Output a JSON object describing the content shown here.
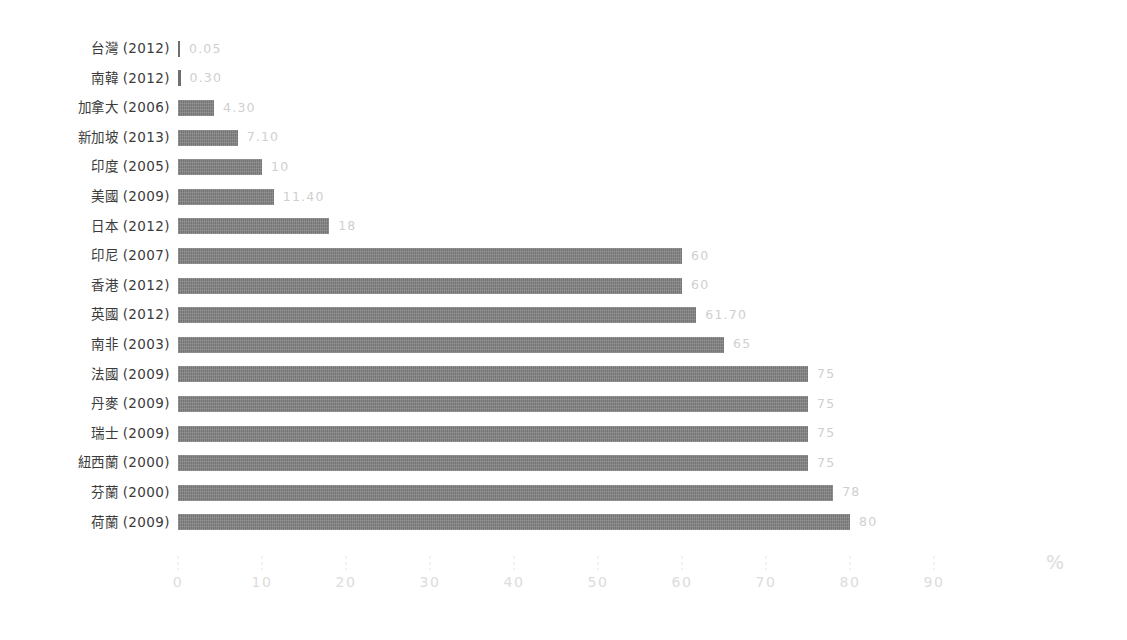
{
  "chart_data": {
    "type": "bar",
    "orientation": "horizontal",
    "title": "",
    "subtitle": "",
    "xlabel": "%",
    "ylabel": "",
    "xlim": [
      0,
      90
    ],
    "grid": false,
    "legend": null,
    "axis": {
      "unit_symbol": "%",
      "ticks": [
        0,
        10,
        20,
        30,
        40,
        50,
        60,
        70,
        80,
        90
      ],
      "tick_labels": [
        "0",
        "10",
        "20",
        "30",
        "40",
        "50",
        "60",
        "70",
        "80",
        "90"
      ]
    },
    "categories": [
      "台灣 (2012)",
      "南韓 (2012)",
      "加拿大 (2006)",
      "新加坡 (2013)",
      "印度 (2005)",
      "美國 (2009)",
      "日本 (2012)",
      "印尼 (2007)",
      "香港 (2012)",
      "英國 (2012)",
      "南非 (2003)",
      "法國 (2009)",
      "丹麥 (2009)",
      "瑞士 (2009)",
      "紐西蘭 (2000)",
      "芬蘭 (2000)",
      "荷蘭 (2009)"
    ],
    "values": [
      0.05,
      0.3,
      4.3,
      7.1,
      10,
      11.4,
      18,
      60,
      60,
      61.7,
      65,
      75,
      75,
      75,
      75,
      78,
      80
    ],
    "value_labels": [
      "0.05",
      "0.30",
      "4.30",
      "7.10",
      "10",
      "11.40",
      "18",
      "60",
      "60",
      "61.70",
      "65",
      "75",
      "75",
      "75",
      "75",
      "78",
      "80"
    ],
    "colors": {
      "bar": "#808080",
      "bar_tiny": "#6f6f6f",
      "category_label": "#3b3b3b",
      "value_label": "#cfcfcf",
      "axis_tick": "#e3e3e3",
      "axis_label": "#dcdcdc",
      "background": "#ffffff"
    }
  },
  "rows": [
    {
      "category": "台灣 (2012)",
      "value": 0.05,
      "value_label": "0.05"
    },
    {
      "category": "南韓 (2012)",
      "value": 0.3,
      "value_label": "0.30"
    },
    {
      "category": "加拿大 (2006)",
      "value": 4.3,
      "value_label": "4.30"
    },
    {
      "category": "新加坡 (2013)",
      "value": 7.1,
      "value_label": "7.10"
    },
    {
      "category": "印度 (2005)",
      "value": 10,
      "value_label": "10"
    },
    {
      "category": "美國 (2009)",
      "value": 11.4,
      "value_label": "11.40"
    },
    {
      "category": "日本 (2012)",
      "value": 18,
      "value_label": "18"
    },
    {
      "category": "印尼 (2007)",
      "value": 60,
      "value_label": "60"
    },
    {
      "category": "香港 (2012)",
      "value": 60,
      "value_label": "60"
    },
    {
      "category": "英國 (2012)",
      "value": 61.7,
      "value_label": "61.70"
    },
    {
      "category": "南非 (2003)",
      "value": 65,
      "value_label": "65"
    },
    {
      "category": "法國 (2009)",
      "value": 75,
      "value_label": "75"
    },
    {
      "category": "丹麥 (2009)",
      "value": 75,
      "value_label": "75"
    },
    {
      "category": "瑞士 (2009)",
      "value": 75,
      "value_label": "75"
    },
    {
      "category": "紐西蘭 (2000)",
      "value": 75,
      "value_label": "75"
    },
    {
      "category": "芬蘭 (2000)",
      "value": 78,
      "value_label": "78"
    },
    {
      "category": "荷蘭 (2009)",
      "value": 80,
      "value_label": "80"
    }
  ],
  "axis": {
    "ticks": [
      "0",
      "10",
      "20",
      "30",
      "40",
      "50",
      "60",
      "70",
      "80",
      "90"
    ],
    "unit_symbol": "%"
  }
}
